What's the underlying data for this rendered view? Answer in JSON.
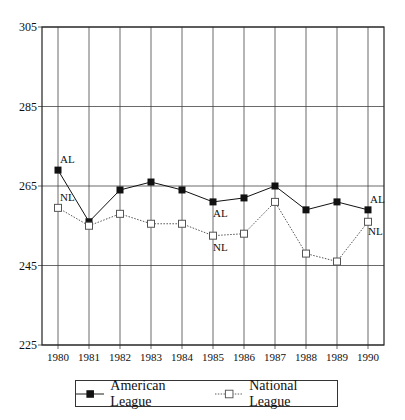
{
  "chart_data": {
    "type": "line",
    "title": "",
    "xlabel": "",
    "ylabel": "",
    "x": [
      1980,
      1981,
      1982,
      1983,
      1984,
      1985,
      1986,
      1987,
      1988,
      1989,
      1990
    ],
    "x_tick_labels": [
      "1980",
      "1981",
      "1982",
      "1983",
      "1984",
      "1985",
      "1986",
      "1987",
      "1988",
      "1989",
      "1990"
    ],
    "y_ticks": [
      225,
      245,
      265,
      285,
      305
    ],
    "ylim": [
      225,
      305
    ],
    "grid": true,
    "legend_position": "bottom",
    "series": [
      {
        "name": "American League",
        "label": "AL",
        "marker": "filled-square",
        "line": "solid",
        "values": [
          269,
          256,
          264,
          266,
          264,
          261,
          262,
          265,
          259,
          261,
          259
        ]
      },
      {
        "name": "National League",
        "label": "NL",
        "marker": "open-square",
        "line": "dotted",
        "values": [
          259.5,
          255,
          258,
          255.5,
          255.5,
          252.5,
          253,
          261,
          248,
          246,
          256
        ]
      }
    ],
    "annotations": [
      {
        "text": "AL",
        "x": 1980,
        "series": "American League",
        "position": "above-right"
      },
      {
        "text": "NL",
        "x": 1980,
        "series": "National League",
        "position": "above-right"
      },
      {
        "text": "AL",
        "x": 1985,
        "series": "American League",
        "position": "below"
      },
      {
        "text": "NL",
        "x": 1985,
        "series": "National League",
        "position": "below"
      },
      {
        "text": "AL",
        "x": 1990,
        "series": "American League",
        "position": "above-right"
      },
      {
        "text": "NL",
        "x": 1990,
        "series": "National League",
        "position": "below-right"
      }
    ]
  },
  "legend": {
    "items": [
      {
        "label": "American League"
      },
      {
        "label": "National League"
      }
    ]
  }
}
